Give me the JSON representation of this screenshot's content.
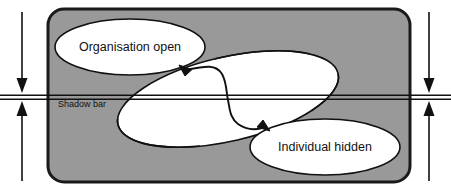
{
  "diagram": {
    "type": "venn-overlap-diagram",
    "colors": {
      "panel_fill": "#999999",
      "panel_stroke": "#1a1a1a",
      "ellipse_fill": "#ffffff",
      "ellipse_stroke": "#111111",
      "bar_stroke": "#111111",
      "arrow_stroke": "#111111",
      "page_background": "#ffffff",
      "text": "#111111"
    },
    "panel": {
      "shape": "rounded-rectangle",
      "x": 48,
      "y": 9,
      "width": 362,
      "height": 173,
      "corner_radius": 16
    },
    "ellipses": [
      {
        "id": "organisation-open",
        "label": "Organisation open",
        "cx": 130,
        "cy": 47,
        "rx": 75,
        "ry": 28,
        "rotation": 0,
        "label_x": 130,
        "label_y": 51
      },
      {
        "id": "shadow-region",
        "label": "",
        "cx": 228,
        "cy": 99,
        "rx": 113,
        "ry": 42,
        "rotation": -13,
        "label_x": 0,
        "label_y": 0
      },
      {
        "id": "individual-hidden",
        "label": "Individual hidden",
        "cx": 325,
        "cy": 147,
        "rx": 75,
        "ry": 28,
        "rotation": 0,
        "label_x": 325,
        "label_y": 151
      }
    ],
    "shadow_bar": {
      "label": "Shadow bar",
      "label_x": 58,
      "label_y": 107,
      "line_top_y": 95,
      "line_bottom_y": 99,
      "x_start": 0,
      "x_end": 451
    },
    "measure_arrows": [
      {
        "id": "left-measure-arrow",
        "x": 22,
        "top_y": 12,
        "bottom_y": 181,
        "heads": "both-inward",
        "meets_y_top": 93,
        "meets_y_bottom": 101
      },
      {
        "id": "right-measure-arrow",
        "x": 429,
        "top_y": 12,
        "bottom_y": 181,
        "heads": "both-inward",
        "meets_y_top": 93,
        "meets_y_bottom": 101
      }
    ],
    "connector_arrow": {
      "id": "s-curve-connector",
      "heads": "both",
      "from": "individual-hidden",
      "to": "organisation-open",
      "description": "double-headed S-shaped curve crossing the shadow bar"
    }
  }
}
